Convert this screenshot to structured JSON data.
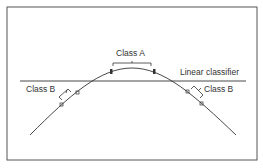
{
  "diagram": {
    "labels": {
      "class_a": "Class A",
      "class_b_left": "Class B",
      "class_b_right": "Class B",
      "linear_classifier": "Linear classifier"
    },
    "colors": {
      "stroke": "#333333",
      "frame": "#555555",
      "background": "#ffffff"
    }
  }
}
